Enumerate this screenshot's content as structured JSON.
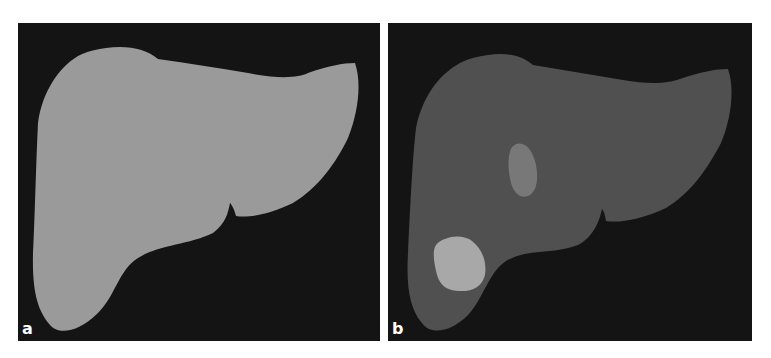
{
  "figure": {
    "panels": [
      {
        "label": "a",
        "description": "Liver segmentation mask (uniform gray on black)",
        "colors": {
          "background": "#141414",
          "liver": "#9a9a9a"
        }
      },
      {
        "label": "b",
        "description": "Liver with two lesions (darker liver, brighter lesions)",
        "colors": {
          "background": "#141414",
          "liver": "#505050",
          "lesion_small": "#787878",
          "lesion_large": "#a8a8a8"
        }
      }
    ]
  }
}
